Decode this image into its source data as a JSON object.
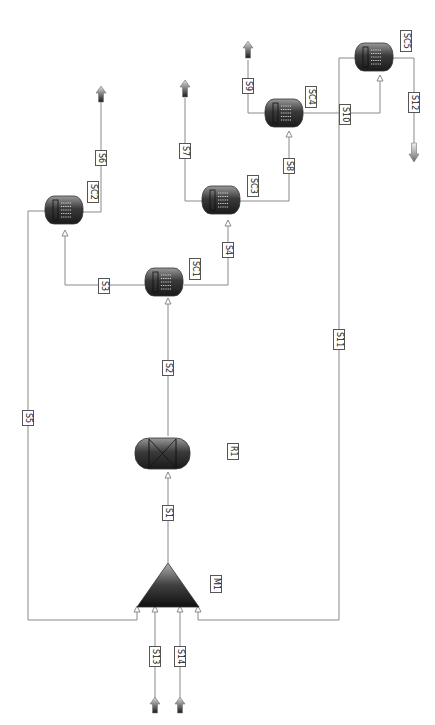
{
  "diagram": {
    "type": "process-flow-diagram",
    "orientation": "rotated-90",
    "colors": {
      "line": "#8a8a8a",
      "equipment_dark": "#1e1e1e",
      "equipment_light": "#9a9a9a",
      "label_border": "#555555"
    },
    "units": [
      {
        "id": "M1",
        "label": "M1",
        "kind": "mixer"
      },
      {
        "id": "R1",
        "label": "R1",
        "kind": "reactor"
      },
      {
        "id": "SC1",
        "label": "SC1",
        "kind": "separator-column"
      },
      {
        "id": "SC2",
        "label": "SC2",
        "kind": "separator-column"
      },
      {
        "id": "SC3",
        "label": "SC3",
        "kind": "separator-column"
      },
      {
        "id": "SC4",
        "label": "SC4",
        "kind": "separator-column"
      },
      {
        "id": "SC5",
        "label": "SC5",
        "kind": "separator-column"
      }
    ],
    "streams": [
      {
        "id": "S1",
        "label": "S1",
        "from": "M1",
        "to": "R1"
      },
      {
        "id": "S2",
        "label": "S2",
        "from": "R1",
        "to": "SC1"
      },
      {
        "id": "S3",
        "label": "S3",
        "from": "SC1",
        "to": "SC2"
      },
      {
        "id": "S4",
        "label": "S4",
        "from": "SC1",
        "to": "SC3"
      },
      {
        "id": "S5",
        "label": "S5",
        "from": "SC2",
        "to": "M1"
      },
      {
        "id": "S6",
        "label": "S6",
        "from": "SC2",
        "to": "product"
      },
      {
        "id": "S7",
        "label": "S7",
        "from": "SC3",
        "to": "product"
      },
      {
        "id": "S8",
        "label": "S8",
        "from": "SC3",
        "to": "SC4"
      },
      {
        "id": "S9",
        "label": "S9",
        "from": "SC4",
        "to": "product"
      },
      {
        "id": "S10",
        "label": "S10",
        "from": "SC4",
        "to": "SC5"
      },
      {
        "id": "S11",
        "label": "S11",
        "from": "SC5",
        "to": "M1"
      },
      {
        "id": "S12",
        "label": "S12",
        "from": "SC5",
        "to": "product"
      },
      {
        "id": "S13",
        "label": "S13",
        "from": "feed",
        "to": "M1"
      },
      {
        "id": "S14",
        "label": "S14",
        "from": "feed",
        "to": "M1"
      }
    ]
  }
}
